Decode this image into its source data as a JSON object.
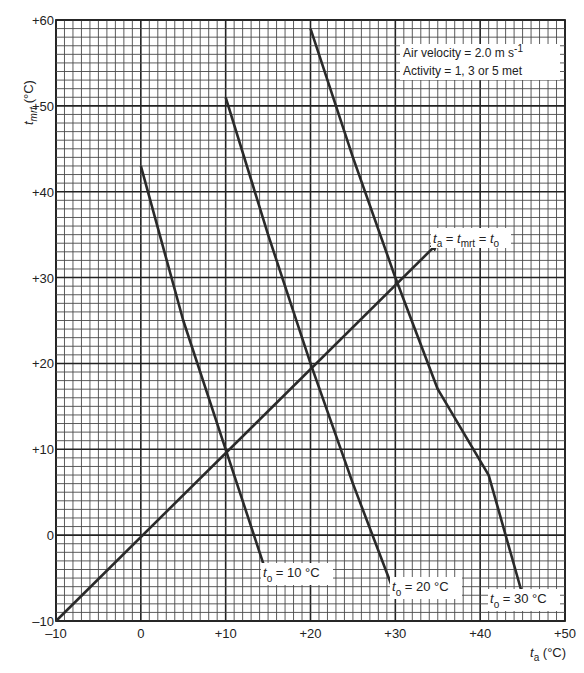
{
  "chart_data": {
    "type": "line",
    "title": "",
    "xlabel": "t_a (°C)",
    "ylabel": "t_mrt (°C)",
    "xlim": [
      -10,
      50
    ],
    "ylim": [
      -10,
      60
    ],
    "grid": true,
    "grid_minor_step": 1,
    "grid_major_step": 10,
    "x_ticks": [
      "-10",
      "0",
      "+10",
      "+20",
      "+30",
      "+40",
      "+50"
    ],
    "y_ticks": [
      "-10",
      "0",
      "+10",
      "+20",
      "+30",
      "+40",
      "+50",
      "+60"
    ],
    "annotations": {
      "info_line_1": "Air velocity  =  2.0 m s",
      "info_line_1_sup": "-1",
      "info_line_2": "Activity  =  1, 3 or 5 met",
      "diagonal_label": "t_a = t_mrt = t_o"
    },
    "series": [
      {
        "name": "t_o = 10 °C",
        "label_main": "t",
        "label_sub": "o",
        "label_rest": " = 10 °C",
        "points": [
          [
            0,
            43
          ],
          [
            5,
            25
          ],
          [
            10,
            10
          ],
          [
            15,
            -5
          ]
        ]
      },
      {
        "name": "t_o = 20 °C",
        "label_main": "t",
        "label_sub": "o",
        "label_rest": " = 20 °C",
        "points": [
          [
            10,
            51
          ],
          [
            15,
            35
          ],
          [
            20,
            20
          ],
          [
            25,
            6
          ],
          [
            30,
            -7
          ]
        ]
      },
      {
        "name": "t_o = 30 °C",
        "label_main": "t",
        "label_sub": "o",
        "label_rest": " = 30 °C",
        "points": [
          [
            20,
            59
          ],
          [
            25,
            44
          ],
          [
            30,
            30
          ],
          [
            35,
            17
          ],
          [
            41,
            7
          ],
          [
            45,
            -7
          ]
        ]
      },
      {
        "name": "t_a = t_mrt = t_o",
        "arrow": true,
        "points": [
          [
            -10,
            -10
          ],
          [
            35,
            34
          ]
        ]
      }
    ]
  },
  "colors": {
    "grid_minor": "#4a4a4a",
    "grid_major": "#222222",
    "line": "#2a2a2a",
    "background": "#ffffff"
  }
}
